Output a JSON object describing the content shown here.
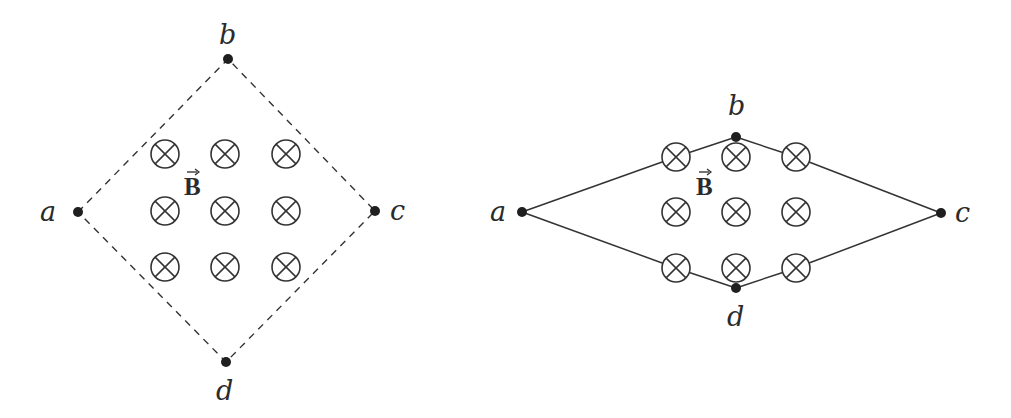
{
  "figure": {
    "left": {
      "title": "Square loop (dashed) in uniform magnetic field",
      "boundary_style": "dashed",
      "nodes": [
        {
          "label": "a",
          "x": 78,
          "y": 212,
          "label_x": 40,
          "label_y": 221
        },
        {
          "label": "b",
          "x": 228,
          "y": 59,
          "label_x": 219,
          "label_y": 44
        },
        {
          "label": "c",
          "x": 375,
          "y": 211,
          "label_x": 390,
          "label_y": 220
        },
        {
          "label": "d",
          "x": 226,
          "y": 362,
          "label_x": 216,
          "label_y": 400
        }
      ],
      "field_label": "B",
      "field_label_pos": {
        "x": 184,
        "y": 195
      },
      "field_grid": {
        "cols": [
          165,
          225,
          286
        ],
        "rows": [
          154,
          211,
          267
        ],
        "radius": 14
      },
      "field_symbol": "into-page (⊗)"
    },
    "right": {
      "title": "Deformed loop (solid) in uniform magnetic field",
      "boundary_style": "solid",
      "nodes": [
        {
          "label": "a",
          "x": 522,
          "y": 212,
          "label_x": 490,
          "label_y": 221
        },
        {
          "label": "b",
          "x": 736,
          "y": 137,
          "label_x": 728,
          "label_y": 115
        },
        {
          "label": "c",
          "x": 941,
          "y": 213,
          "label_x": 955,
          "label_y": 222
        },
        {
          "label": "d",
          "x": 736,
          "y": 288,
          "label_x": 727,
          "label_y": 326
        }
      ],
      "field_label": "B",
      "field_label_pos": {
        "x": 696,
        "y": 195
      },
      "field_grid": {
        "cols": [
          676,
          736,
          796
        ],
        "rows": [
          157,
          212,
          268
        ],
        "radius": 14
      },
      "field_symbol": "into-page (⊗)"
    }
  }
}
